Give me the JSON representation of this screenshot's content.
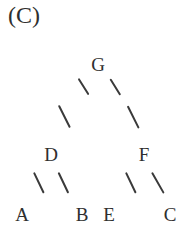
{
  "figure": {
    "panel_label": "(C)",
    "background_color": "#ffffff",
    "ink_color": "#2f2f2f",
    "width": 191,
    "height": 232
  },
  "chart_data": {
    "type": "diagram",
    "diagram_kind": "binary-tree",
    "title": "(C)",
    "nodes": [
      {
        "id": "G",
        "label": "G",
        "level": 0,
        "x": 98,
        "y": 64
      },
      {
        "id": "D",
        "label": "D",
        "level": 1,
        "x": 51,
        "y": 154
      },
      {
        "id": "F",
        "label": "F",
        "level": 1,
        "x": 144,
        "y": 154
      },
      {
        "id": "A",
        "label": "A",
        "level": 2,
        "x": 22,
        "y": 214
      },
      {
        "id": "B",
        "label": "B",
        "level": 2,
        "x": 82,
        "y": 214
      },
      {
        "id": "E",
        "label": "E",
        "level": 2,
        "x": 109,
        "y": 214
      },
      {
        "id": "C",
        "label": "C",
        "level": 2,
        "x": 170,
        "y": 214
      }
    ],
    "edges": [
      {
        "from": "G",
        "to": "D",
        "glyph": "/"
      },
      {
        "from": "G",
        "to": "F",
        "glyph": "\\"
      },
      {
        "from": "D",
        "to": "A",
        "glyph": "/"
      },
      {
        "from": "D",
        "to": "B",
        "glyph": "\\"
      },
      {
        "from": "F",
        "to": "E",
        "glyph": "/"
      },
      {
        "from": "F",
        "to": "C",
        "glyph": "\\"
      }
    ],
    "edge_segments": [
      {
        "name": "g-d-upper",
        "x1": 88,
        "y1": 95,
        "x2": 78,
        "y2": 79
      },
      {
        "name": "g-d-lower",
        "x1": 70,
        "y1": 128,
        "x2": 59,
        "y2": 106
      },
      {
        "name": "g-f-upper",
        "x1": 110,
        "y1": 79,
        "x2": 120,
        "y2": 95
      },
      {
        "name": "g-f-lower",
        "x1": 128,
        "y1": 106,
        "x2": 139,
        "y2": 128
      },
      {
        "name": "d-a",
        "x1": 44,
        "y1": 193,
        "x2": 34,
        "y2": 172
      },
      {
        "name": "d-b",
        "x1": 59,
        "y1": 172,
        "x2": 69,
        "y2": 193
      },
      {
        "name": "f-e",
        "x1": 136,
        "y1": 193,
        "x2": 126,
        "y2": 172
      },
      {
        "name": "f-c",
        "x1": 152,
        "y1": 172,
        "x2": 164,
        "y2": 193
      }
    ],
    "root": "G",
    "leaves": [
      "A",
      "B",
      "E",
      "C"
    ],
    "internal_nodes": [
      "G",
      "D",
      "F"
    ],
    "legend": null,
    "axes": null,
    "grid": false
  }
}
